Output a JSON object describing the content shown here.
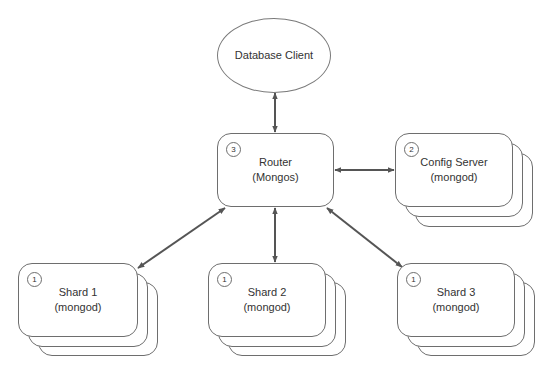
{
  "diagram": {
    "type": "architecture",
    "colors": {
      "stroke": "#6e6e6e",
      "arrow": "#555555",
      "text": "#333333",
      "fill": "#ffffff"
    },
    "client": {
      "label": "Database Client"
    },
    "router": {
      "badge": "3",
      "line1": "Router",
      "line2": "(Mongos)"
    },
    "config_server": {
      "badge": "2",
      "line1": "Config Server",
      "line2": "(mongod)"
    },
    "shards": [
      {
        "badge": "1",
        "line1": "Shard 1",
        "line2": "(mongod)"
      },
      {
        "badge": "1",
        "line1": "Shard 2",
        "line2": "(mongod)"
      },
      {
        "badge": "1",
        "line1": "Shard 3",
        "line2": "(mongod)"
      }
    ],
    "edges": [
      {
        "from": "Database Client",
        "to": "Router",
        "direction": "bidirectional"
      },
      {
        "from": "Router",
        "to": "Config Server",
        "direction": "bidirectional"
      },
      {
        "from": "Router",
        "to": "Shard 1",
        "direction": "bidirectional"
      },
      {
        "from": "Router",
        "to": "Shard 2",
        "direction": "bidirectional"
      },
      {
        "from": "Router",
        "to": "Shard 3",
        "direction": "bidirectional"
      }
    ]
  }
}
